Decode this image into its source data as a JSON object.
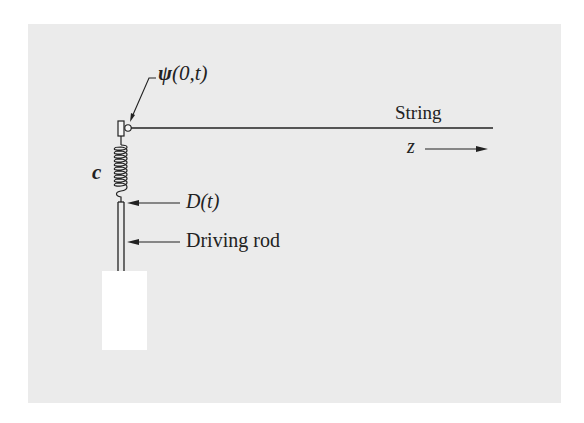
{
  "diagram": {
    "labels": {
      "psi": "ψ",
      "psi_args": "(0,t)",
      "string": "String",
      "z": "z",
      "c": "c",
      "d": "D(t)",
      "rod": "Driving rod"
    },
    "colors": {
      "background": "#ebebeb",
      "ink": "#222222",
      "block": "#ffffff"
    }
  }
}
